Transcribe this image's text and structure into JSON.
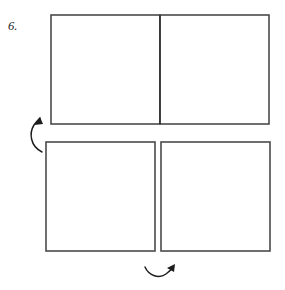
{
  "figure": {
    "label": "6.",
    "kind": "geometric-tile-puzzle",
    "background_color": "#ffffff",
    "line_color": "#2b2b2b",
    "border_color": "#4a4a4a"
  },
  "canvas": {
    "width": 285,
    "height": 290
  },
  "tiles": [
    {
      "id": "top-left",
      "name": "tile-top-left",
      "x": 51,
      "y": 15,
      "size": 109,
      "orientation": "diamond-upper-left",
      "mirrored": false
    },
    {
      "id": "top-right",
      "name": "tile-top-right",
      "x": 160,
      "y": 15,
      "size": 109,
      "orientation": "diamond-upper-right",
      "mirrored": true
    },
    {
      "id": "bottom-left",
      "name": "tile-bottom-left",
      "x": 46,
      "y": 142,
      "size": 109,
      "orientation": "diamond-lower-left",
      "mirrored": false
    },
    {
      "id": "bottom-right",
      "name": "tile-bottom-right",
      "x": 161,
      "y": 142,
      "size": 109,
      "orientation": "diamond-lower-right",
      "mirrored": true
    }
  ],
  "groups": [
    {
      "id": "top-rectangle",
      "name": "top-rectangle-group",
      "tiles": [
        "top-left",
        "top-right"
      ],
      "has_center_divider": true
    },
    {
      "id": "bottom-pair",
      "name": "bottom-pair-group",
      "tiles": [
        "bottom-left",
        "bottom-right"
      ],
      "has_center_divider": false,
      "gap": 6
    }
  ],
  "arrows": [
    {
      "id": "left-arrow",
      "name": "rotation-arrow-left",
      "direction": "up-right",
      "style": "curved",
      "position": {
        "x": 30,
        "y": 116,
        "width": 26,
        "height": 36
      }
    },
    {
      "id": "bottom-arrow",
      "name": "rotation-arrow-bottom",
      "direction": "up-right",
      "style": "curved",
      "position": {
        "x": 144,
        "y": 262,
        "width": 34,
        "height": 20
      }
    }
  ],
  "pattern": {
    "description": "Each square tile contains a rotated inner diamond with a nested rectangle and parallel diagonal bands filling the remaining corners.",
    "band_count": 3,
    "diamond_inset": 0.0,
    "inner_rect_offset": 0.16
  }
}
